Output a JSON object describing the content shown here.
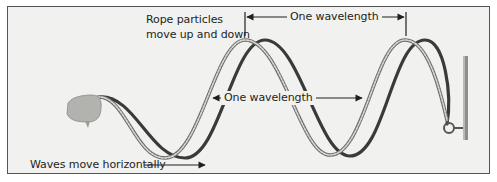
{
  "figure": {
    "type": "diagram",
    "labels": {
      "top_wavelength": "One wavelength",
      "middle_wavelength": "One wavelength",
      "rope_particles_line1": "Rope particles",
      "rope_particles_line2": "move up and down",
      "waves_direction": "Waves move horizontally"
    },
    "elements": [
      {
        "name": "hand",
        "description": "Hand holding the rope end at left"
      },
      {
        "name": "rope-wave-1",
        "style": "striped gray rope"
      },
      {
        "name": "rope-wave-2",
        "style": "dark solid rope"
      },
      {
        "name": "wall-post",
        "description": "Vertical post at right with ring attachment"
      },
      {
        "name": "top-wavelength-bracket",
        "description": "Double arrow between crests"
      },
      {
        "name": "middle-wavelength-arrow",
        "description": "Double arrow between rope segments"
      },
      {
        "name": "horizontal-direction-arrow",
        "description": "Arrow pointing right"
      }
    ],
    "colors": {
      "background": "#f1f1ef",
      "frame_border": "#555555",
      "rope_light": "#9a9a96",
      "rope_dark": "#3a3a3a",
      "text": "#231f20"
    }
  }
}
